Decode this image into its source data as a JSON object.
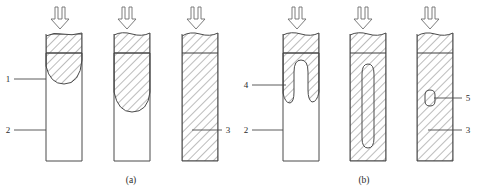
{
  "figure": {
    "title": "",
    "background_color": "#ffffff",
    "line_color": "#4a4a4a",
    "hatch_color": "#6a6a6a",
    "text_color": "#2b2b2b",
    "width": 481,
    "height": 193
  },
  "captions": [
    {
      "id": "caption-a",
      "text": "(a)",
      "x": 131,
      "y": 183
    },
    {
      "id": "caption-b",
      "text": "(b)",
      "x": 364,
      "y": 183
    }
  ],
  "callouts": [
    {
      "id": "callout-1",
      "text": "1",
      "text_x": 8,
      "text_y": 82,
      "leader_x1": 14,
      "leader_y1": 79,
      "leader_x2": 46,
      "leader_y2": 79,
      "side": "left",
      "meaning": "partially-fused-zone"
    },
    {
      "id": "callout-2",
      "text": "2",
      "text_x": 8,
      "text_y": 133,
      "leader_x1": 14,
      "leader_y1": 130,
      "leader_x2": 46,
      "leader_y2": 130,
      "side": "left",
      "meaning": "unmelted-base-material"
    },
    {
      "id": "callout-3",
      "text": "3",
      "text_x": 226,
      "text_y": 133,
      "leader_x1": 192,
      "leader_y1": 130,
      "leader_x2": 222,
      "leader_y2": 130,
      "side": "right",
      "meaning": "fully-fused-region"
    },
    {
      "id": "callout-4",
      "text": "4",
      "text_x": 245,
      "text_y": 88,
      "leader_x1": 252,
      "leader_y1": 85,
      "leader_x2": 283,
      "leader_y2": 85,
      "side": "left",
      "meaning": "annular-fusion-shell"
    },
    {
      "id": "callout-2b",
      "text": "2",
      "text_x": 245,
      "text_y": 133,
      "leader_x1": 252,
      "leader_y1": 130,
      "leader_x2": 283,
      "leader_y2": 130,
      "side": "left",
      "meaning": "unmelted-base-material"
    },
    {
      "id": "callout-5",
      "text": "5",
      "text_x": 466,
      "text_y": 101,
      "leader_x1": 437,
      "leader_y1": 98,
      "leader_x2": 462,
      "leader_y2": 98,
      "side": "right",
      "meaning": "residual-void-pore"
    },
    {
      "id": "callout-3b",
      "text": "3",
      "text_x": 466,
      "text_y": 133,
      "leader_x1": 437,
      "leader_y1": 130,
      "leader_x2": 462,
      "leader_y2": 130,
      "side": "right",
      "meaning": "fully-fused-region"
    }
  ],
  "arrows": [
    {
      "id": "arrow-a1",
      "cx": 60,
      "top": 6,
      "bottom": 30,
      "direction": "down"
    },
    {
      "id": "arrow-a2",
      "cx": 127,
      "top": 6,
      "bottom": 30,
      "direction": "down"
    },
    {
      "id": "arrow-a3",
      "cx": 196,
      "top": 6,
      "bottom": 30,
      "direction": "down"
    },
    {
      "id": "arrow-b1",
      "cx": 297,
      "top": 6,
      "bottom": 30,
      "direction": "down"
    },
    {
      "id": "arrow-b2",
      "cx": 363,
      "top": 6,
      "bottom": 30,
      "direction": "down"
    },
    {
      "id": "arrow-b3",
      "cx": 430,
      "top": 6,
      "bottom": 30,
      "direction": "down"
    }
  ],
  "columns": [
    {
      "id": "column-a1",
      "group": "a",
      "stage": 1,
      "x": 46,
      "y": 34,
      "width": 36,
      "height": 127,
      "divider_y": 53,
      "cap_bulge": true,
      "fusion_shape": "shallow-bowl",
      "fusion_depth": 27
    },
    {
      "id": "column-a2",
      "group": "a",
      "stage": 2,
      "x": 114,
      "y": 34,
      "width": 36,
      "height": 127,
      "divider_y": 53,
      "cap_bulge": false,
      "fusion_shape": "deep-bowl",
      "fusion_depth": 56
    },
    {
      "id": "column-a3",
      "group": "a",
      "stage": 3,
      "x": 182,
      "y": 34,
      "width": 36,
      "height": 127,
      "divider_y": 53,
      "cap_bulge": true,
      "fusion_shape": "full",
      "fusion_depth": 127
    },
    {
      "id": "column-b1",
      "group": "b",
      "stage": 1,
      "x": 283,
      "y": 34,
      "width": 36,
      "height": 127,
      "divider_y": 53,
      "cap_bulge": true,
      "fusion_shape": "shallow-annulus",
      "fusion_depth": 48
    },
    {
      "id": "column-b2",
      "group": "b",
      "stage": 2,
      "x": 350,
      "y": 34,
      "width": 36,
      "height": 127,
      "divider_y": 53,
      "cap_bulge": false,
      "fusion_shape": "deep-annulus",
      "fusion_depth": 115
    },
    {
      "id": "column-b3",
      "group": "b",
      "stage": 3,
      "x": 417,
      "y": 34,
      "width": 36,
      "height": 127,
      "divider_y": 53,
      "cap_bulge": true,
      "fusion_shape": "full-with-void",
      "fusion_depth": 127
    }
  ],
  "void": {
    "id": "residual-void",
    "cx": 430,
    "cy": 98,
    "rx": 5,
    "ry": 8
  }
}
